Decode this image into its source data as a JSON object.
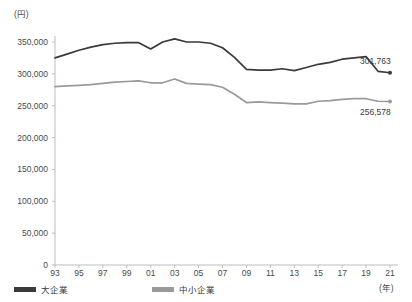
{
  "chart_data": {
    "type": "line",
    "title": "",
    "subtitle": "",
    "xlabel": "(年)",
    "ylabel": "(円)",
    "ylim": [
      0,
      350000
    ],
    "ytick_values": [
      0,
      50000,
      100000,
      150000,
      200000,
      250000,
      300000,
      350000
    ],
    "ytick_labels": [
      "0",
      "50,000",
      "100,000",
      "150,000",
      "200,000",
      "250,000",
      "300,000",
      "350,000"
    ],
    "grid": false,
    "legend_position": "bottom-left",
    "x": [
      1993,
      1994,
      1995,
      1996,
      1997,
      1998,
      1999,
      2000,
      2001,
      2002,
      2003,
      2004,
      2005,
      2006,
      2007,
      2008,
      2009,
      2010,
      2011,
      2012,
      2013,
      2014,
      2015,
      2016,
      2017,
      2018,
      2019,
      2020,
      2021
    ],
    "xtick_labels": [
      "93",
      "95",
      "97",
      "99",
      "01",
      "03",
      "05",
      "07",
      "09",
      "11",
      "13",
      "15",
      "17",
      "19",
      "21"
    ],
    "xtick_values": [
      1993,
      1995,
      1997,
      1999,
      2001,
      2003,
      2005,
      2007,
      2009,
      2011,
      2013,
      2015,
      2017,
      2019,
      2021
    ],
    "series": [
      {
        "name": "大企業",
        "color": "#3a3a3a",
        "end_label": "301,763",
        "values": [
          325000,
          331000,
          337000,
          342000,
          346000,
          348000,
          349000,
          349000,
          339000,
          350000,
          355000,
          350000,
          350000,
          348000,
          341000,
          326000,
          307000,
          306000,
          306000,
          308000,
          305000,
          310000,
          315000,
          318000,
          323000,
          325000,
          327000,
          304000,
          301763
        ]
      },
      {
        "name": "中小企業",
        "color": "#9a9a9a",
        "end_label": "256,578",
        "values": [
          280000,
          281000,
          282000,
          283000,
          285000,
          287000,
          288000,
          289000,
          286000,
          286000,
          292000,
          285000,
          284000,
          283000,
          279000,
          268000,
          255000,
          256000,
          255000,
          254000,
          253000,
          253000,
          257000,
          258000,
          260000,
          261000,
          261000,
          257000,
          256578
        ]
      }
    ]
  },
  "legend": {
    "items": [
      {
        "label": "大企業",
        "color": "#3a3a3a"
      },
      {
        "label": "中小企業",
        "color": "#9a9a9a"
      }
    ]
  },
  "axis": {
    "y_unit": "(円)",
    "x_unit": "(年)"
  }
}
